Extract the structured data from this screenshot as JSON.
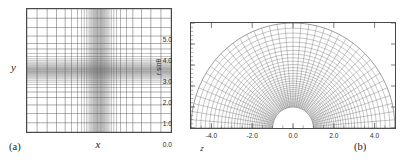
{
  "figure": {
    "caption_tag_a": "(a)",
    "caption_tag_b": "(b)"
  },
  "panel_a": {
    "tag": "(a)",
    "xlabel": "x",
    "ylabel": "y"
  },
  "panel_b": {
    "tag": "(b)",
    "xlabel": "z",
    "ylabel": "r sinθ",
    "xticklabels": [
      "-4.0",
      "-2.0",
      "0.0",
      "2.0",
      "4.0"
    ],
    "yticklabels": [
      "0.0",
      "1.0",
      "2.0",
      "3.0",
      "4.0",
      "5.0"
    ]
  },
  "colors": {
    "frame": "#4a4a4a",
    "grid": "#555555",
    "grid_light": "#999999",
    "background": "#ffffff",
    "text": "#1a1a1a"
  },
  "chart_data": [
    {
      "type": "line",
      "name": "cartesian-adaptive-mesh",
      "title": "",
      "xlabel": "x",
      "ylabel": "y",
      "grid": true,
      "legend": "none",
      "description": "Two-dimensional Cartesian computational grid with strong mesh refinement clustered toward the center of the domain in both x and y.",
      "xlim": [
        -1,
        1
      ],
      "ylim": [
        -1,
        1
      ],
      "n_vertical_lines": 61,
      "n_horizontal_lines": 53,
      "clustering": "tanh-stretched toward origin",
      "vertical_line_positions": [
        -1.0,
        -0.86,
        -0.72,
        -0.59,
        -0.47,
        -0.38,
        -0.3,
        -0.245,
        -0.205,
        -0.175,
        -0.152,
        -0.134,
        -0.119,
        -0.106,
        -0.095,
        -0.085,
        -0.076,
        -0.068,
        -0.061,
        -0.054,
        -0.048,
        -0.042,
        -0.037,
        -0.032,
        -0.027,
        -0.023,
        -0.019,
        -0.015,
        -0.011,
        -0.0055,
        0.0,
        0.0055,
        0.011,
        0.015,
        0.019,
        0.023,
        0.027,
        0.032,
        0.037,
        0.042,
        0.048,
        0.054,
        0.061,
        0.068,
        0.076,
        0.085,
        0.095,
        0.106,
        0.119,
        0.134,
        0.152,
        0.175,
        0.205,
        0.245,
        0.3,
        0.38,
        0.47,
        0.59,
        0.72,
        0.86,
        1.0
      ],
      "horizontal_line_positions": [
        -1.0,
        -0.85,
        -0.7,
        -0.56,
        -0.44,
        -0.35,
        -0.28,
        -0.23,
        -0.19,
        -0.16,
        -0.138,
        -0.12,
        -0.105,
        -0.092,
        -0.08,
        -0.07,
        -0.061,
        -0.053,
        -0.046,
        -0.04,
        -0.034,
        -0.029,
        -0.024,
        -0.019,
        -0.015,
        -0.011,
        -0.0055,
        0.0,
        0.0055,
        0.011,
        0.015,
        0.019,
        0.024,
        0.029,
        0.034,
        0.04,
        0.046,
        0.053,
        0.061,
        0.07,
        0.08,
        0.092,
        0.105,
        0.12,
        0.138,
        0.16,
        0.19,
        0.23,
        0.28,
        0.35,
        0.44,
        0.56,
        0.7,
        0.85,
        1.0
      ]
    },
    {
      "type": "line",
      "name": "spherical-polar-mesh",
      "title": "",
      "xlabel": "z",
      "ylabel": "r sinθ",
      "grid": true,
      "legend": "none",
      "description": "Half-annulus spherical-polar computational grid spanning theta from 0 to pi, with radial cells strongly clustered near the inner boundary r = 1 and extending to r = 5.",
      "xlim": [
        -5.0,
        5.0
      ],
      "ylim": [
        0.0,
        5.0
      ],
      "xticks": [
        -4.0,
        -2.0,
        0.0,
        2.0,
        4.0
      ],
      "yticks": [
        0.0,
        1.0,
        2.0,
        3.0,
        4.0,
        5.0
      ],
      "r_inner": 1.0,
      "r_outer": 5.0,
      "theta_min_deg": 0,
      "theta_max_deg": 180,
      "n_radial_lines": 33,
      "n_angular_lines": 41,
      "radial_ring_radii": [
        1.0,
        1.022,
        1.047,
        1.075,
        1.107,
        1.143,
        1.184,
        1.23,
        1.282,
        1.341,
        1.408,
        1.483,
        1.568,
        1.664,
        1.772,
        1.894,
        2.031,
        2.186,
        2.36,
        2.556,
        2.777,
        3.025,
        3.305,
        3.62,
        3.974,
        4.372,
        4.82,
        5.0
      ],
      "angular_line_angles_deg": [
        0,
        4.5,
        9,
        13.5,
        18,
        22.5,
        27,
        31.5,
        36,
        40.5,
        45,
        49.5,
        54,
        58.5,
        63,
        67.5,
        72,
        76.5,
        81,
        85.5,
        90,
        94.5,
        99,
        103.5,
        108,
        112.5,
        117,
        121.5,
        126,
        130.5,
        135,
        139.5,
        144,
        148.5,
        153,
        157.5,
        162,
        166.5,
        171,
        175.5,
        180
      ]
    }
  ]
}
